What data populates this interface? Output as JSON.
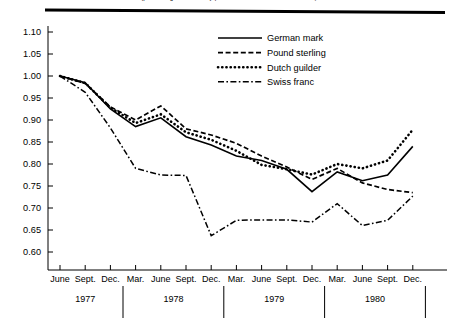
{
  "figure": {
    "title_partial": "(percentage of currency per U.S. dollar, June 1977 = 1.00)",
    "rule_color": "#000000"
  },
  "legend": {
    "position": "top-right",
    "entries": [
      {
        "label": "German mark",
        "style": "solid",
        "name": "german-mark"
      },
      {
        "label": "Pound sterling",
        "style": "dashed",
        "name": "pound-sterling"
      },
      {
        "label": "Dutch guilder",
        "style": "dotted",
        "name": "dutch-guilder"
      },
      {
        "label": "Swiss franc",
        "style": "dashdot",
        "name": "swiss-franc"
      }
    ]
  },
  "chart_data": {
    "type": "line",
    "title": "(percentage of currency per U.S. dollar, June 1977 = 1.00)",
    "xlabel": "",
    "ylabel": "",
    "ylim": [
      0.575,
      1.125
    ],
    "grid": false,
    "legend_position": "top-right",
    "x": [
      "June 1977",
      "Sept. 1977",
      "Dec. 1977",
      "Mar. 1978",
      "June 1978",
      "Sept. 1978",
      "Dec. 1978",
      "Mar. 1979",
      "June 1979",
      "Sept. 1979",
      "Dec. 1979",
      "Mar. 1980",
      "June 1980",
      "Sept. 1980",
      "Dec. 1980"
    ],
    "categories": [
      "June",
      "Sept.",
      "Dec.",
      "Mar.",
      "June",
      "Sept.",
      "Dec.",
      "Mar.",
      "June",
      "Sept.",
      "Dec.",
      "Mar.",
      "June",
      "Sept.",
      "Dec."
    ],
    "year_groups": [
      {
        "year": "1977",
        "start_index": 0,
        "end_index": 2
      },
      {
        "year": "1978",
        "start_index": 3,
        "end_index": 6
      },
      {
        "year": "1979",
        "start_index": 7,
        "end_index": 10
      },
      {
        "year": "1980",
        "start_index": 11,
        "end_index": 14
      }
    ],
    "ytick_labels": [
      "1.10",
      "1.05",
      "1.00",
      "0.95",
      "0.90",
      "0.85",
      "0.80",
      "0.75",
      "0.70",
      "0.65",
      "0.60"
    ],
    "ytick_values": [
      1.1,
      1.05,
      1.0,
      0.95,
      0.9,
      0.85,
      0.8,
      0.75,
      0.7,
      0.65,
      0.6
    ],
    "series": [
      {
        "name": "German mark",
        "style": "solid",
        "values": [
          1.0,
          0.985,
          0.925,
          0.885,
          0.905,
          0.862,
          0.843,
          0.818,
          0.808,
          0.788,
          0.737,
          0.782,
          0.762,
          0.775,
          0.84
        ]
      },
      {
        "name": "Pound sterling",
        "style": "dashed",
        "values": [
          1.0,
          0.983,
          0.93,
          0.9,
          0.932,
          0.88,
          0.866,
          0.847,
          0.818,
          0.793,
          0.765,
          0.79,
          0.757,
          0.742,
          0.735
        ]
      },
      {
        "name": "Dutch guilder",
        "style": "dotted",
        "values": [
          1.0,
          0.984,
          0.928,
          0.893,
          0.913,
          0.872,
          0.855,
          0.83,
          0.798,
          0.788,
          0.776,
          0.8,
          0.79,
          0.808,
          0.878
        ]
      },
      {
        "name": "Swiss franc",
        "style": "dashdot",
        "values": [
          1.0,
          0.963,
          0.882,
          0.79,
          0.775,
          0.774,
          0.637,
          0.672,
          0.673,
          0.673,
          0.668,
          0.71,
          0.66,
          0.672,
          0.727
        ]
      }
    ]
  }
}
